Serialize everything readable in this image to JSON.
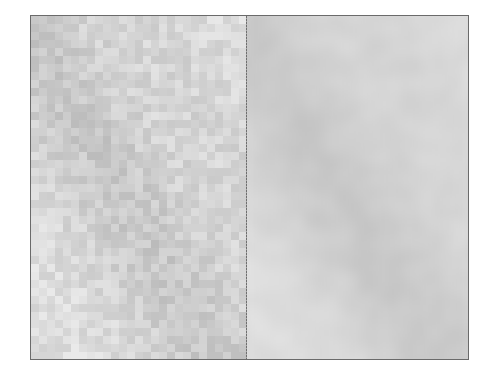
{
  "figure": {
    "left_panel": {
      "label": "",
      "style": "pixelated-mosaic",
      "block_size": 8
    },
    "right_panel": {
      "label": "",
      "style": "smooth-blurred"
    },
    "colors": {
      "border": "#6a6a6a",
      "divider": "#6e6e6e",
      "light_gray": "#e0e0e0",
      "mid_gray": "#d2d2d2",
      "dark_gray": "#bdbdbd"
    },
    "texture": {
      "seed": 7,
      "band_direction": "top-left-to-bottom-right"
    }
  }
}
